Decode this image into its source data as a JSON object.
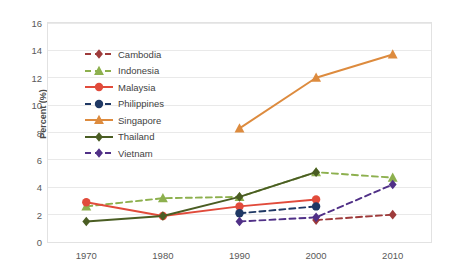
{
  "chart_data": {
    "type": "line",
    "title": "",
    "xlabel": "",
    "ylabel": "Percent (%)",
    "x": [
      1970,
      1980,
      1990,
      2000,
      2010
    ],
    "categories": [
      "1970",
      "1980",
      "1990",
      "2000",
      "2010"
    ],
    "xtick_labels": [
      "1970",
      "1980",
      "1990",
      "2000",
      "2010"
    ],
    "ytick_labels": [
      "0",
      "2",
      "4",
      "6",
      "8",
      "10",
      "12",
      "14",
      "16"
    ],
    "yticks": [
      0,
      2,
      4,
      6,
      8,
      10,
      12,
      14,
      16
    ],
    "ylim": [
      0,
      16
    ],
    "xlim": [
      1965,
      2015
    ],
    "grid": "horizontal",
    "legend_position": "inside-upper-left",
    "series": [
      {
        "name": "Cambodia",
        "color": "#9E3B3B",
        "marker": "diamond",
        "dash": "dashed",
        "x": [
          2000,
          2010
        ],
        "values": [
          1.6,
          2.0
        ]
      },
      {
        "name": "Indonesia",
        "color": "#8DB04E",
        "marker": "triangle",
        "dash": "dashed",
        "x": [
          1970,
          1980,
          1990,
          2000,
          2010
        ],
        "values": [
          2.6,
          3.2,
          3.3,
          5.1,
          4.7
        ]
      },
      {
        "name": "Malaysia",
        "color": "#E14B3B",
        "marker": "circle",
        "dash": "solid",
        "x": [
          1970,
          1980,
          1990,
          2000
        ],
        "values": [
          2.9,
          1.9,
          2.6,
          3.1
        ]
      },
      {
        "name": "Philippines",
        "color": "#1F3864",
        "marker": "circle",
        "dash": "dashed",
        "x": [
          1990,
          2000
        ],
        "values": [
          2.1,
          2.6
        ]
      },
      {
        "name": "Singapore",
        "color": "#DD8B3E",
        "marker": "triangle",
        "dash": "solid",
        "x": [
          1990,
          2000,
          2010
        ],
        "values": [
          8.3,
          12.0,
          13.7
        ]
      },
      {
        "name": "Thailand",
        "color": "#4A5D23",
        "marker": "diamond",
        "dash": "solid",
        "x": [
          1970,
          1980,
          1990,
          2000
        ],
        "values": [
          1.5,
          1.9,
          3.3,
          5.1
        ]
      },
      {
        "name": "Vietnam",
        "color": "#503087",
        "marker": "diamond",
        "dash": "dashed",
        "x": [
          1990,
          2000,
          2010
        ],
        "values": [
          1.5,
          1.8,
          4.2
        ]
      }
    ]
  },
  "legend": {
    "items": [
      {
        "label": "Cambodia"
      },
      {
        "label": "Indonesia"
      },
      {
        "label": "Malaysia"
      },
      {
        "label": "Philippines"
      },
      {
        "label": "Singapore"
      },
      {
        "label": "Thailand"
      },
      {
        "label": "Vietnam"
      }
    ]
  },
  "colors": {
    "grid": "#E9E9E9",
    "frame": "#E2E2E2",
    "text": "#595959",
    "axis_title": "#4A4A4A",
    "background": "#FFFFFF"
  }
}
